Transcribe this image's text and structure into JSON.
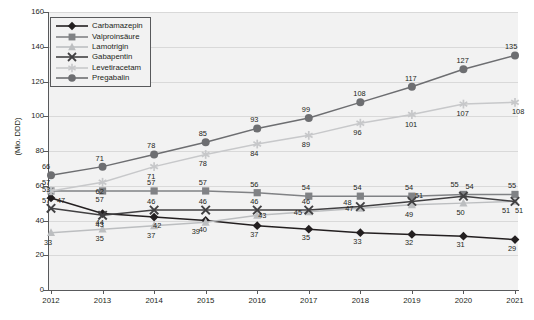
{
  "chart_data": {
    "type": "line",
    "title": "",
    "xlabel": "",
    "ylabel": "(Mio. DDD)",
    "categories": [
      "2012",
      "2013",
      "2014",
      "2015",
      "2016",
      "2017",
      "2018",
      "2019",
      "2020",
      "2021"
    ],
    "ylim": [
      0,
      160
    ],
    "ytick_step": 20,
    "yticks": [
      "0",
      "20",
      "40",
      "60",
      "80",
      "100",
      "120",
      "140",
      "160"
    ],
    "grid": true,
    "legend_position": "top-left",
    "series": [
      {
        "name": "Carbamazepin",
        "color": "#231f20",
        "marker": "diamond",
        "values": [
          53,
          44,
          42,
          40,
          37,
          35,
          33,
          32,
          31,
          29
        ],
        "labels": [
          "53",
          "44",
          "42",
          "40",
          "37",
          "35",
          "33",
          "32",
          "31",
          "29"
        ]
      },
      {
        "name": "Valproinsäure",
        "color": "#808285",
        "marker": "square",
        "values": [
          57,
          57,
          57,
          57,
          56,
          54,
          54,
          54,
          55,
          55
        ],
        "labels": [
          "57",
          "57",
          "57",
          "57",
          "56",
          "54",
          "54",
          "54",
          "55",
          "55"
        ]
      },
      {
        "name": "Lamotrigin",
        "color": "#bcbec0",
        "marker": "triangle",
        "values": [
          33,
          35,
          37,
          39,
          43,
          45,
          47,
          49,
          50,
          51
        ],
        "labels": [
          "33",
          "35",
          "37",
          "39",
          "43",
          "45",
          "47",
          "49",
          "50",
          "51"
        ]
      },
      {
        "name": "Gabapentin",
        "color": "#414042",
        "marker": "cross",
        "values": [
          47,
          43,
          46,
          46,
          46,
          46,
          48,
          51,
          54,
          51
        ],
        "labels": [
          "47",
          "43",
          "46",
          "46",
          "46",
          "46",
          "48",
          "51",
          "54",
          "51"
        ]
      },
      {
        "name": "Levetiracetam",
        "color": "#c7c8ca",
        "marker": "asterisk",
        "values": [
          57,
          62,
          71,
          78,
          84,
          89,
          96,
          101,
          107,
          108
        ],
        "labels": [
          "57",
          "62",
          "71",
          "78",
          "84",
          "89",
          "96",
          "101",
          "107",
          "108"
        ]
      },
      {
        "name": "Pregabalin",
        "color": "#6d6e71",
        "marker": "circle",
        "values": [
          66,
          71,
          78,
          85,
          93,
          99,
          108,
          117,
          127,
          135
        ],
        "labels": [
          "66",
          "71",
          "78",
          "85",
          "93",
          "99",
          "108",
          "117",
          "127",
          "135"
        ]
      }
    ],
    "label_offsets": {
      "Carbamazepin": [
        [
          -2,
          -8
        ],
        [
          0,
          9
        ],
        [
          6,
          9
        ],
        [
          0,
          9
        ],
        [
          0,
          9
        ],
        [
          0,
          9
        ],
        [
          0,
          9
        ],
        [
          0,
          9
        ],
        [
          0,
          9
        ],
        [
          0,
          9
        ]
      ],
      "Valproinsäure": [
        [
          -2,
          -8
        ],
        [
          0,
          9
        ],
        [
          0,
          -8
        ],
        [
          0,
          -8
        ],
        [
          0,
          -8
        ],
        [
          0,
          -8
        ],
        [
          0,
          -8
        ],
        [
          0,
          -8
        ],
        [
          -6,
          -9
        ],
        [
          0,
          -8
        ]
      ],
      "Lamotrigin": [
        [
          0,
          10
        ],
        [
          0,
          10
        ],
        [
          0,
          10
        ],
        [
          -7,
          10
        ],
        [
          8,
          1
        ],
        [
          -8,
          1
        ],
        [
          -8,
          1
        ],
        [
          0,
          10
        ],
        [
          0,
          10
        ],
        [
          -6,
          10
        ]
      ],
      "Gabapentin": [
        [
          13,
          -7
        ],
        [
          0,
          10
        ],
        [
          0,
          -8
        ],
        [
          0,
          -8
        ],
        [
          0,
          -8
        ],
        [
          0,
          -8
        ],
        [
          -10,
          -4
        ],
        [
          10,
          -5
        ],
        [
          9,
          -9
        ],
        [
          7,
          10
        ]
      ],
      "Levetiracetam": [
        [
          -2,
          10
        ],
        [
          0,
          10
        ],
        [
          0,
          10
        ],
        [
          0,
          10
        ],
        [
          0,
          10
        ],
        [
          0,
          10
        ],
        [
          0,
          10
        ],
        [
          0,
          10
        ],
        [
          0,
          10
        ],
        [
          4,
          10
        ]
      ],
      "Pregabalin": [
        [
          -2,
          -8
        ],
        [
          0,
          -8
        ],
        [
          0,
          -8
        ],
        [
          0,
          -8
        ],
        [
          0,
          -8
        ],
        [
          0,
          -8
        ],
        [
          0,
          -8
        ],
        [
          0,
          -8
        ],
        [
          0,
          -8
        ],
        [
          -3,
          -8
        ]
      ]
    }
  },
  "legend": {
    "items": [
      {
        "label": "Carbamazepin"
      },
      {
        "label": "Valproinsäure"
      },
      {
        "label": "Lamotrigin"
      },
      {
        "label": "Gabapentin"
      },
      {
        "label": "Levetiracetam"
      },
      {
        "label": "Pregabalin"
      }
    ]
  }
}
